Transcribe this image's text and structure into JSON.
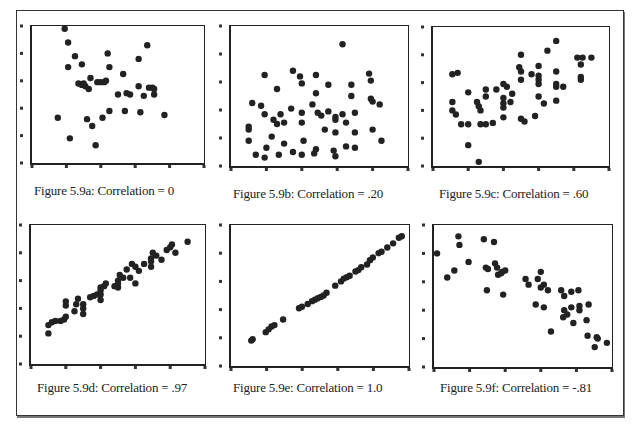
{
  "figure": {
    "captions": [
      "Figure 5.9a: Correlation = 0",
      "Figure 5.9b: Correlation = .20",
      "Figure 5.9c: Correlation = .60",
      "Figure 5.9d: Correlation = .97",
      "Figure 5.9e: Correlation = 1.0",
      "Figure 5.9f: Correlation = -.81"
    ],
    "dot_color": "#222222",
    "frame_color": "#222222"
  },
  "chart_data": [
    {
      "type": "scatter",
      "title": "Figure 5.9a: Correlation = 0",
      "correlation": 0,
      "xlabel": "",
      "ylabel": "",
      "xlim": [
        0,
        1
      ],
      "ylim": [
        0,
        1
      ],
      "grid": false,
      "points": [
        [
          0.19,
          0.98
        ],
        [
          0.21,
          0.88
        ],
        [
          0.25,
          0.78
        ],
        [
          0.21,
          0.7
        ],
        [
          0.29,
          0.72
        ],
        [
          0.44,
          0.8
        ],
        [
          0.45,
          0.7
        ],
        [
          0.53,
          0.65
        ],
        [
          0.62,
          0.76
        ],
        [
          0.67,
          0.86
        ],
        [
          0.27,
          0.58
        ],
        [
          0.29,
          0.57
        ],
        [
          0.3,
          0.58
        ],
        [
          0.31,
          0.56
        ],
        [
          0.33,
          0.54
        ],
        [
          0.38,
          0.59
        ],
        [
          0.4,
          0.59
        ],
        [
          0.43,
          0.6
        ],
        [
          0.34,
          0.62
        ],
        [
          0.42,
          0.59
        ],
        [
          0.5,
          0.5
        ],
        [
          0.55,
          0.51
        ],
        [
          0.57,
          0.5
        ],
        [
          0.62,
          0.56
        ],
        [
          0.65,
          0.49
        ],
        [
          0.68,
          0.55
        ],
        [
          0.7,
          0.55
        ],
        [
          0.71,
          0.54
        ],
        [
          0.71,
          0.5
        ],
        [
          0.45,
          0.38
        ],
        [
          0.54,
          0.38
        ],
        [
          0.63,
          0.37
        ],
        [
          0.77,
          0.35
        ],
        [
          0.15,
          0.33
        ],
        [
          0.32,
          0.32
        ],
        [
          0.41,
          0.33
        ],
        [
          0.35,
          0.27
        ],
        [
          0.22,
          0.18
        ],
        [
          0.37,
          0.13
        ]
      ]
    },
    {
      "type": "scatter",
      "title": "Figure 5.9b: Correlation = .20",
      "correlation": 0.2,
      "xlabel": "",
      "ylabel": "",
      "xlim": [
        0,
        1
      ],
      "ylim": [
        0,
        1
      ],
      "grid": false,
      "points": [
        [
          0.63,
          0.87
        ],
        [
          0.19,
          0.65
        ],
        [
          0.35,
          0.68
        ],
        [
          0.39,
          0.64
        ],
        [
          0.48,
          0.65
        ],
        [
          0.78,
          0.66
        ],
        [
          0.79,
          0.61
        ],
        [
          0.4,
          0.59
        ],
        [
          0.26,
          0.55
        ],
        [
          0.55,
          0.58
        ],
        [
          0.68,
          0.58
        ],
        [
          0.48,
          0.52
        ],
        [
          0.68,
          0.5
        ],
        [
          0.79,
          0.48
        ],
        [
          0.8,
          0.46
        ],
        [
          0.84,
          0.44
        ],
        [
          0.12,
          0.45
        ],
        [
          0.17,
          0.43
        ],
        [
          0.19,
          0.37
        ],
        [
          0.28,
          0.37
        ],
        [
          0.34,
          0.41
        ],
        [
          0.4,
          0.38
        ],
        [
          0.46,
          0.44
        ],
        [
          0.49,
          0.38
        ],
        [
          0.51,
          0.36
        ],
        [
          0.55,
          0.39
        ],
        [
          0.59,
          0.35
        ],
        [
          0.63,
          0.37
        ],
        [
          0.7,
          0.38
        ],
        [
          0.24,
          0.33
        ],
        [
          0.26,
          0.3
        ],
        [
          0.3,
          0.31
        ],
        [
          0.4,
          0.31
        ],
        [
          0.59,
          0.33
        ],
        [
          0.65,
          0.31
        ],
        [
          0.1,
          0.28
        ],
        [
          0.1,
          0.26
        ],
        [
          0.53,
          0.26
        ],
        [
          0.59,
          0.24
        ],
        [
          0.7,
          0.24
        ],
        [
          0.8,
          0.26
        ],
        [
          0.1,
          0.18
        ],
        [
          0.23,
          0.21
        ],
        [
          0.41,
          0.18
        ],
        [
          0.2,
          0.13
        ],
        [
          0.3,
          0.16
        ],
        [
          0.48,
          0.12
        ],
        [
          0.58,
          0.11
        ],
        [
          0.65,
          0.14
        ],
        [
          0.7,
          0.13
        ],
        [
          0.85,
          0.18
        ],
        [
          0.14,
          0.08
        ],
        [
          0.19,
          0.06
        ],
        [
          0.27,
          0.08
        ],
        [
          0.35,
          0.1
        ],
        [
          0.4,
          0.08
        ],
        [
          0.47,
          0.09
        ],
        [
          0.59,
          0.07
        ]
      ]
    },
    {
      "type": "scatter",
      "title": "Figure 5.9c: Correlation = .60",
      "correlation": 0.6,
      "xlabel": "",
      "ylabel": "",
      "xlim": [
        0,
        1
      ],
      "ylim": [
        0,
        1
      ],
      "grid": false,
      "points": [
        [
          0.7,
          0.9
        ],
        [
          0.65,
          0.83
        ],
        [
          0.5,
          0.8
        ],
        [
          0.82,
          0.78
        ],
        [
          0.85,
          0.78
        ],
        [
          0.9,
          0.78
        ],
        [
          0.84,
          0.73
        ],
        [
          0.49,
          0.71
        ],
        [
          0.5,
          0.68
        ],
        [
          0.6,
          0.72
        ],
        [
          0.7,
          0.68
        ],
        [
          0.11,
          0.66
        ],
        [
          0.14,
          0.67
        ],
        [
          0.56,
          0.66
        ],
        [
          0.6,
          0.65
        ],
        [
          0.84,
          0.64
        ],
        [
          0.84,
          0.62
        ],
        [
          0.5,
          0.62
        ],
        [
          0.6,
          0.62
        ],
        [
          0.6,
          0.59
        ],
        [
          0.4,
          0.59
        ],
        [
          0.7,
          0.59
        ],
        [
          0.7,
          0.57
        ],
        [
          0.74,
          0.57
        ],
        [
          0.3,
          0.55
        ],
        [
          0.36,
          0.55
        ],
        [
          0.42,
          0.57
        ],
        [
          0.45,
          0.52
        ],
        [
          0.2,
          0.53
        ],
        [
          0.3,
          0.5
        ],
        [
          0.4,
          0.49
        ],
        [
          0.44,
          0.46
        ],
        [
          0.11,
          0.46
        ],
        [
          0.25,
          0.46
        ],
        [
          0.6,
          0.5
        ],
        [
          0.63,
          0.45
        ],
        [
          0.7,
          0.47
        ],
        [
          0.4,
          0.45
        ],
        [
          0.4,
          0.42
        ],
        [
          0.26,
          0.43
        ],
        [
          0.27,
          0.4
        ],
        [
          0.11,
          0.4
        ],
        [
          0.13,
          0.37
        ],
        [
          0.4,
          0.35
        ],
        [
          0.5,
          0.34
        ],
        [
          0.52,
          0.32
        ],
        [
          0.58,
          0.36
        ],
        [
          0.16,
          0.3
        ],
        [
          0.2,
          0.3
        ],
        [
          0.27,
          0.3
        ],
        [
          0.3,
          0.3
        ],
        [
          0.34,
          0.31
        ],
        [
          0.2,
          0.15
        ],
        [
          0.26,
          0.03
        ]
      ]
    },
    {
      "type": "scatter",
      "title": "Figure 5.9d: Correlation = .97",
      "correlation": 0.97,
      "xlabel": "",
      "ylabel": "",
      "xlim": [
        0,
        1
      ],
      "ylim": [
        0,
        1
      ],
      "grid": false,
      "points": [
        [
          0.1,
          0.22
        ],
        [
          0.1,
          0.28
        ],
        [
          0.12,
          0.3
        ],
        [
          0.14,
          0.31
        ],
        [
          0.17,
          0.31
        ],
        [
          0.19,
          0.32
        ],
        [
          0.2,
          0.34
        ],
        [
          0.2,
          0.42
        ],
        [
          0.2,
          0.45
        ],
        [
          0.25,
          0.38
        ],
        [
          0.26,
          0.43
        ],
        [
          0.27,
          0.47
        ],
        [
          0.3,
          0.36
        ],
        [
          0.3,
          0.4
        ],
        [
          0.3,
          0.43
        ],
        [
          0.34,
          0.48
        ],
        [
          0.36,
          0.49
        ],
        [
          0.38,
          0.5
        ],
        [
          0.4,
          0.46
        ],
        [
          0.4,
          0.5
        ],
        [
          0.4,
          0.53
        ],
        [
          0.4,
          0.55
        ],
        [
          0.42,
          0.56
        ],
        [
          0.43,
          0.58
        ],
        [
          0.48,
          0.56
        ],
        [
          0.5,
          0.55
        ],
        [
          0.5,
          0.58
        ],
        [
          0.5,
          0.6
        ],
        [
          0.51,
          0.64
        ],
        [
          0.53,
          0.62
        ],
        [
          0.55,
          0.68
        ],
        [
          0.57,
          0.62
        ],
        [
          0.58,
          0.72
        ],
        [
          0.6,
          0.58
        ],
        [
          0.6,
          0.7
        ],
        [
          0.62,
          0.67
        ],
        [
          0.65,
          0.72
        ],
        [
          0.69,
          0.7
        ],
        [
          0.69,
          0.74
        ],
        [
          0.69,
          0.76
        ],
        [
          0.7,
          0.8
        ],
        [
          0.72,
          0.78
        ],
        [
          0.75,
          0.75
        ],
        [
          0.78,
          0.82
        ],
        [
          0.8,
          0.84
        ],
        [
          0.81,
          0.86
        ],
        [
          0.83,
          0.8
        ],
        [
          0.9,
          0.88
        ]
      ]
    },
    {
      "type": "scatter",
      "title": "Figure 5.9e: Correlation = 1.0",
      "correlation": 1.0,
      "xlabel": "",
      "ylabel": "",
      "xlim": [
        0,
        1
      ],
      "ylim": [
        0,
        1
      ],
      "grid": false,
      "points": [
        [
          0.14,
          0.18
        ],
        [
          0.15,
          0.19
        ],
        [
          0.24,
          0.24
        ],
        [
          0.26,
          0.26
        ],
        [
          0.28,
          0.28
        ],
        [
          0.3,
          0.29
        ],
        [
          0.36,
          0.33
        ],
        [
          0.47,
          0.41
        ],
        [
          0.49,
          0.42
        ],
        [
          0.53,
          0.44
        ],
        [
          0.56,
          0.46
        ],
        [
          0.58,
          0.47
        ],
        [
          0.6,
          0.48
        ],
        [
          0.62,
          0.49
        ],
        [
          0.64,
          0.5
        ],
        [
          0.66,
          0.52
        ],
        [
          0.72,
          0.57
        ],
        [
          0.76,
          0.6
        ],
        [
          0.78,
          0.62
        ],
        [
          0.8,
          0.63
        ],
        [
          0.82,
          0.64
        ],
        [
          0.86,
          0.67
        ],
        [
          0.88,
          0.68
        ],
        [
          0.9,
          0.7
        ],
        [
          0.94,
          0.72
        ],
        [
          0.96,
          0.75
        ],
        [
          0.98,
          0.77
        ],
        [
          1.02,
          0.8
        ],
        [
          1.04,
          0.81
        ],
        [
          1.08,
          0.84
        ],
        [
          1.12,
          0.87
        ],
        [
          1.16,
          0.91
        ],
        [
          1.18,
          0.92
        ]
      ]
    },
    {
      "type": "scatter",
      "title": "Figure 5.9f: Correlation = -.81",
      "correlation": -0.81,
      "xlabel": "",
      "ylabel": "",
      "xlim": [
        0,
        1
      ],
      "ylim": [
        0,
        1
      ],
      "grid": false,
      "points": [
        [
          0.03,
          0.8
        ],
        [
          0.13,
          0.63
        ],
        [
          0.2,
          0.68
        ],
        [
          0.24,
          0.92
        ],
        [
          0.25,
          0.86
        ],
        [
          0.34,
          0.74
        ],
        [
          0.49,
          0.9
        ],
        [
          0.51,
          0.7
        ],
        [
          0.53,
          0.69
        ],
        [
          0.52,
          0.54
        ],
        [
          0.59,
          0.88
        ],
        [
          0.6,
          0.73
        ],
        [
          0.62,
          0.7
        ],
        [
          0.63,
          0.65
        ],
        [
          0.66,
          0.66
        ],
        [
          0.67,
          0.67
        ],
        [
          0.7,
          0.68
        ],
        [
          0.68,
          0.51
        ],
        [
          0.9,
          0.62
        ],
        [
          0.93,
          0.58
        ],
        [
          1.05,
          0.67
        ],
        [
          1.08,
          0.58
        ],
        [
          1.12,
          0.54
        ],
        [
          1.02,
          0.62
        ],
        [
          1.05,
          0.56
        ],
        [
          1.0,
          0.44
        ],
        [
          1.08,
          0.42
        ],
        [
          1.15,
          0.25
        ],
        [
          1.25,
          0.54
        ],
        [
          1.28,
          0.5
        ],
        [
          1.28,
          0.4
        ],
        [
          1.31,
          0.37
        ],
        [
          1.27,
          0.35
        ],
        [
          1.35,
          0.53
        ],
        [
          1.35,
          0.42
        ],
        [
          1.37,
          0.31
        ],
        [
          1.42,
          0.54
        ],
        [
          1.43,
          0.43
        ],
        [
          1.43,
          0.4
        ],
        [
          1.5,
          0.33
        ],
        [
          1.52,
          0.44
        ],
        [
          1.51,
          0.22
        ],
        [
          1.6,
          0.21
        ],
        [
          1.61,
          0.2
        ],
        [
          1.58,
          0.14
        ],
        [
          1.7,
          0.17
        ]
      ]
    }
  ]
}
